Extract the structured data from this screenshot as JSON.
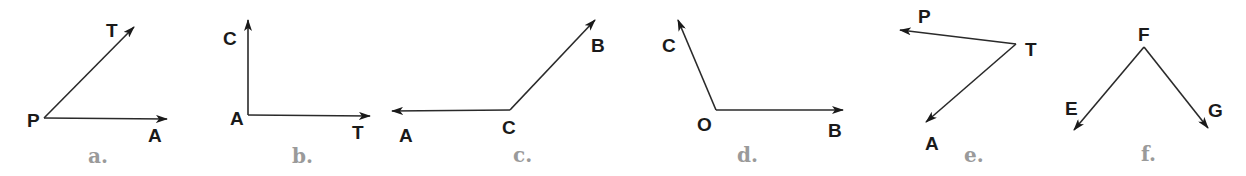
{
  "figures": [
    {
      "caption": "a.",
      "vertex": {
        "label": "P",
        "x": 44,
        "y": 118,
        "lx": 27,
        "ly": 127
      },
      "rays": [
        {
          "label": "T",
          "tip": [
            134,
            27
          ],
          "lx": 106,
          "ly": 37
        },
        {
          "label": "A",
          "tip": [
            167,
            119
          ],
          "lx": 148,
          "ly": 142
        }
      ],
      "cx": 88,
      "cy": 163
    },
    {
      "caption": "b.",
      "vertex": {
        "label": "A",
        "x": 248,
        "y": 115,
        "lx": 230,
        "ly": 125
      },
      "rays": [
        {
          "label": "C",
          "tip": [
            248,
            20
          ],
          "lx": 223,
          "ly": 45
        },
        {
          "label": "T",
          "tip": [
            370,
            116
          ],
          "lx": 352,
          "ly": 139
        }
      ],
      "cx": 292,
      "cy": 163
    },
    {
      "caption": "c.",
      "vertex": {
        "label": "C",
        "x": 510,
        "y": 110,
        "lx": 502,
        "ly": 134
      },
      "rays": [
        {
          "label": "A",
          "tip": [
            392,
            111
          ],
          "lx": 399,
          "ly": 142
        },
        {
          "label": "B",
          "tip": [
            595,
            20
          ],
          "lx": 591,
          "ly": 52
        }
      ],
      "cx": 513,
      "cy": 162
    },
    {
      "caption": "d.",
      "vertex": {
        "label": "O",
        "x": 716,
        "y": 110,
        "lx": 697,
        "ly": 131
      },
      "rays": [
        {
          "label": "C",
          "tip": [
            678,
            20
          ],
          "lx": 662,
          "ly": 52
        },
        {
          "label": "B",
          "tip": [
            843,
            110
          ],
          "lx": 828,
          "ly": 137
        }
      ],
      "cx": 737,
      "cy": 162
    },
    {
      "caption": "e.",
      "vertex": {
        "label": "T",
        "x": 1016,
        "y": 44,
        "lx": 1025,
        "ly": 56
      },
      "rays": [
        {
          "label": "P",
          "tip": [
            900,
            30
          ],
          "lx": 918,
          "ly": 23
        },
        {
          "label": "A",
          "tip": [
            926,
            122
          ],
          "lx": 925,
          "ly": 150
        }
      ],
      "cx": 964,
      "cy": 162
    },
    {
      "caption": "f.",
      "vertex": {
        "label": "F",
        "x": 1144,
        "y": 47,
        "lx": 1138,
        "ly": 41
      },
      "rays": [
        {
          "label": "E",
          "tip": [
            1074,
            130
          ],
          "lx": 1065,
          "ly": 115
        },
        {
          "label": "G",
          "tip": [
            1208,
            128
          ],
          "lx": 1208,
          "ly": 117
        }
      ],
      "cx": 1141,
      "cy": 161
    }
  ]
}
